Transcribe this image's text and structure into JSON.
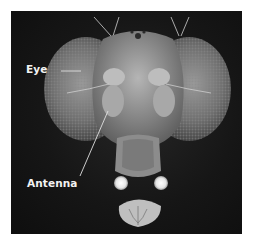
{
  "figure": {
    "labels": [
      {
        "id": "eye",
        "text": "Eye"
      },
      {
        "id": "antenna",
        "text": "Antenna"
      }
    ],
    "colors": {
      "background": "#ffffff",
      "frame": "#161616",
      "label_text": "#f2f2f2"
    }
  }
}
